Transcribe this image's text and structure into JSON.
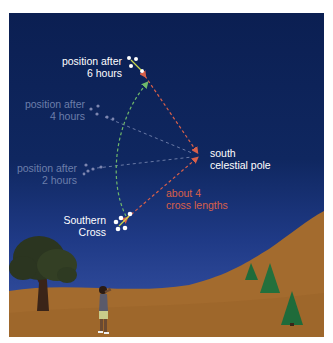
{
  "labels": {
    "pos6": [
      "position after",
      "6 hours"
    ],
    "pos4": [
      "position after",
      "4 hours"
    ],
    "pos2": [
      "position after",
      "2 hours"
    ],
    "pole": [
      "south",
      "celestial pole"
    ],
    "distance": [
      "about 4",
      "cross lengths"
    ],
    "cross": [
      "Southern",
      "Cross"
    ]
  },
  "colors": {
    "sky_top": "#0b1f52",
    "sky_bottom": "#3a55a8",
    "ground": "#a36b2e",
    "arrow_red": "#d8604a",
    "arc_green": "#6fb86a",
    "label_dim": "#6c7eaa",
    "tree_green": "#1f6b3a"
  }
}
